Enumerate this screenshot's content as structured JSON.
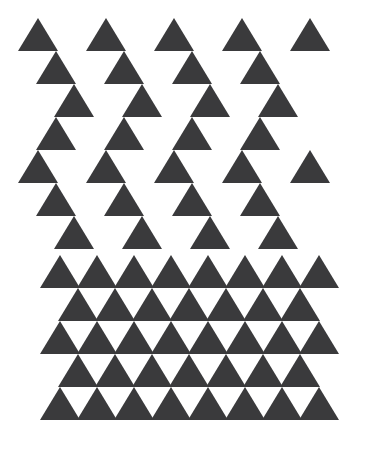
{
  "figure": {
    "name": "triangle-density-gradient",
    "width": 378,
    "height": 449,
    "background_color": "#ffffff",
    "triangle_color": "#3a3a3c",
    "triangle_width": 40,
    "triangle_height": 33
  },
  "chart_data": {
    "type": "scatter",
    "title": "",
    "subtitle": "",
    "xlabel": "",
    "ylabel": "",
    "xlim": [
      0,
      378
    ],
    "ylim": [
      0,
      449
    ],
    "grid": false,
    "legend": null,
    "marker": "triangle-up",
    "marker_width": 40,
    "marker_height": 33,
    "marker_color": "#3a3a3c",
    "background_color": "#ffffff",
    "annotations": [],
    "rows": [
      {
        "index": 1,
        "density": "sparse",
        "y_top": 18,
        "count": 5,
        "x_lefts": [
          18,
          86,
          154,
          222,
          290
        ]
      },
      {
        "index": 2,
        "density": "sparse",
        "y_top": 51,
        "count": 4,
        "x_lefts": [
          36,
          104,
          172,
          240
        ]
      },
      {
        "index": 3,
        "density": "sparse",
        "y_top": 84,
        "count": 4,
        "x_lefts": [
          54,
          122,
          190,
          258
        ]
      },
      {
        "index": 4,
        "density": "sparse",
        "y_top": 117,
        "count": 4,
        "x_lefts": [
          36,
          104,
          172,
          240
        ]
      },
      {
        "index": 5,
        "density": "sparse",
        "y_top": 150,
        "count": 5,
        "x_lefts": [
          18,
          86,
          154,
          222,
          290
        ]
      },
      {
        "index": 6,
        "density": "sparse",
        "y_top": 183,
        "count": 4,
        "x_lefts": [
          36,
          104,
          172,
          240
        ]
      },
      {
        "index": 7,
        "density": "sparse",
        "y_top": 216,
        "count": 4,
        "x_lefts": [
          54,
          122,
          190,
          258
        ]
      },
      {
        "index": 8,
        "density": "dense",
        "y_top": 255,
        "count": 8,
        "x_lefts": [
          40,
          77,
          114,
          151,
          188,
          225,
          262,
          299
        ]
      },
      {
        "index": 9,
        "density": "dense",
        "y_top": 288,
        "count": 7,
        "x_lefts": [
          58,
          95,
          132,
          169,
          206,
          243,
          280
        ]
      },
      {
        "index": 10,
        "density": "dense",
        "y_top": 321,
        "count": 8,
        "x_lefts": [
          40,
          77,
          114,
          151,
          188,
          225,
          262,
          299
        ]
      },
      {
        "index": 11,
        "density": "dense",
        "y_top": 354,
        "count": 7,
        "x_lefts": [
          58,
          95,
          132,
          169,
          206,
          243,
          280
        ]
      },
      {
        "index": 12,
        "density": "dense",
        "y_top": 387,
        "count": 8,
        "x_lefts": [
          40,
          77,
          114,
          151,
          188,
          225,
          262,
          299
        ]
      }
    ],
    "summary": {
      "total_triangles": 68,
      "sparse_rows": 7,
      "dense_rows": 5,
      "sparse_row_spacing_y": 33,
      "dense_row_spacing_y": 33,
      "sparse_column_spacing_x": 68,
      "dense_column_spacing_x": 37
    }
  }
}
